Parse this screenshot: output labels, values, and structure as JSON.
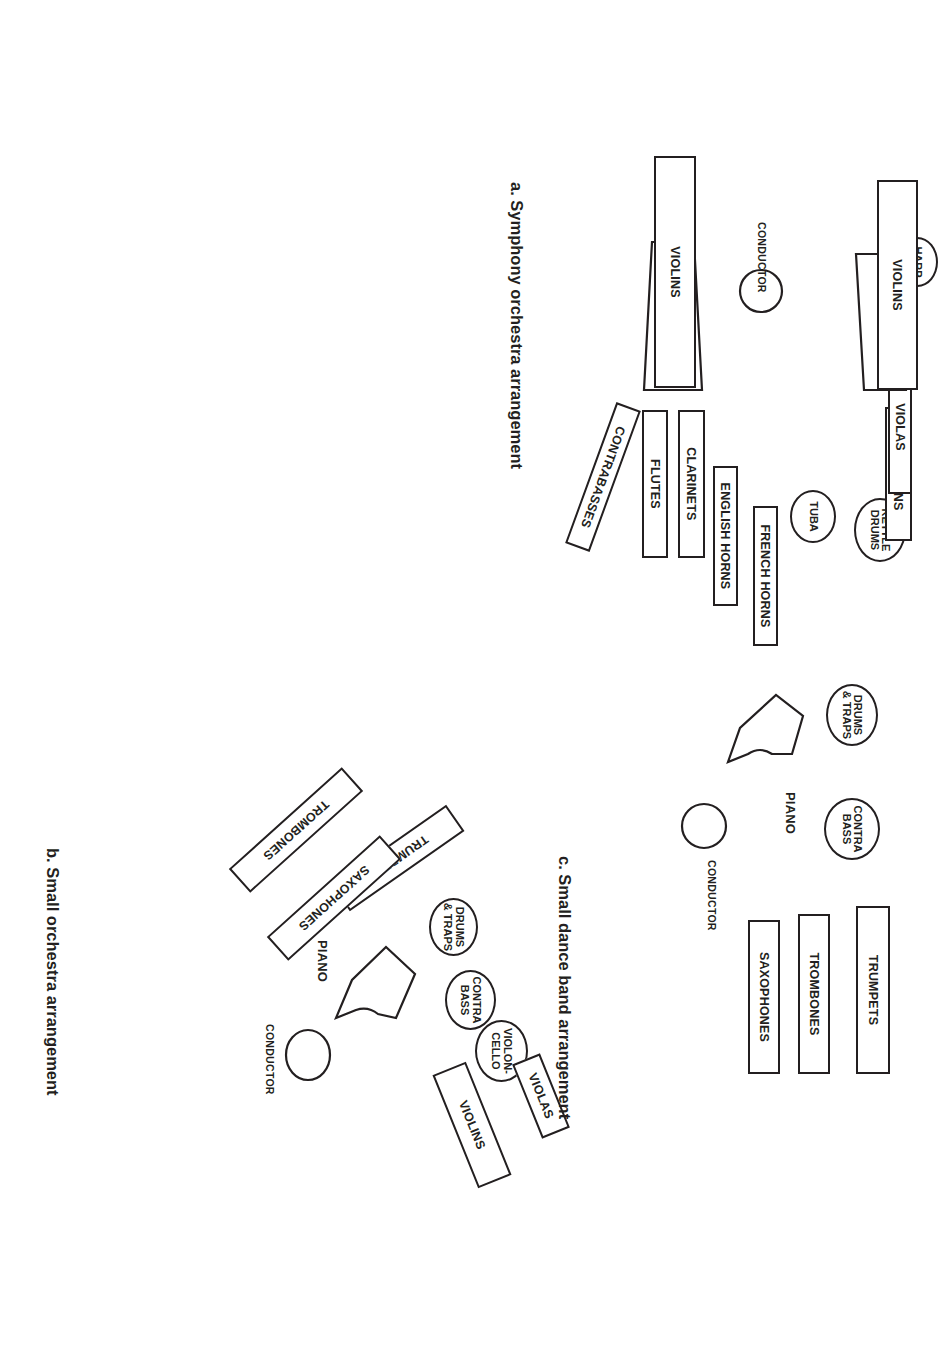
{
  "page": {
    "background": "#ffffff",
    "ink": "#231f20",
    "width": 924,
    "height": 1356,
    "orientation": "landscape-rotated-90"
  },
  "panels": [
    {
      "id": "a",
      "caption": "a. Symphony orchestra arrangement",
      "conductor_label": "CONDUCTOR",
      "sections": [
        {
          "name": "kettle-drums",
          "label": "KETTLE\nDRUMS",
          "shape": "ellipse"
        },
        {
          "name": "tuba",
          "label": "TUBA",
          "shape": "ellipse"
        },
        {
          "name": "bassoons",
          "label": "BASSOONS",
          "shape": "rect"
        },
        {
          "name": "violas-back",
          "label": "VIOLAS",
          "shape": "rect"
        },
        {
          "name": "violas-front",
          "label": "VIOLAS",
          "shape": "trapezoid"
        },
        {
          "name": "harp",
          "label": "HARP",
          "shape": "ellipse"
        },
        {
          "name": "violins-right",
          "label": "VIOLINS",
          "shape": "rect"
        },
        {
          "name": "french-horns",
          "label": "FRENCH HORNS",
          "shape": "rect"
        },
        {
          "name": "english-horns",
          "label": "ENGLISH HORNS",
          "shape": "rect"
        },
        {
          "name": "clarinets",
          "label": "CLARINETS",
          "shape": "rect"
        },
        {
          "name": "flutes",
          "label": "FLUTES",
          "shape": "rect"
        },
        {
          "name": "contrabasses",
          "label": "CONTRABASSES",
          "shape": "rect-rotated"
        },
        {
          "name": "violon-cellos",
          "label": "VIOLON-CELLOS",
          "shape": "trapezoid"
        },
        {
          "name": "violins-left",
          "label": "VIOLINS",
          "shape": "rect"
        }
      ]
    },
    {
      "id": "b",
      "caption": "b. Small orchestra arrangement",
      "conductor_label": "CONDUCTOR",
      "piano_label": "PIANO",
      "sections": [
        {
          "name": "drums-traps",
          "label": "DRUMS\n& TRAPS",
          "shape": "ellipse"
        },
        {
          "name": "contra-bass",
          "label": "CONTRA\nBASS",
          "shape": "ellipse"
        },
        {
          "name": "violon-cello",
          "label": "VIOLON-\nCELLO",
          "shape": "ellipse"
        },
        {
          "name": "violas",
          "label": "VIOLAS",
          "shape": "rect-rotated"
        },
        {
          "name": "violins",
          "label": "VIOLINS",
          "shape": "rect-rotated"
        },
        {
          "name": "piano",
          "label": "PIANO",
          "shape": "piano"
        },
        {
          "name": "trumpets",
          "label": "TRUMPETS",
          "shape": "rect-rotated"
        },
        {
          "name": "saxophones",
          "label": "SAXOPHONES",
          "shape": "rect-rotated"
        },
        {
          "name": "trombones",
          "label": "TROMBONES",
          "shape": "rect-rotated"
        }
      ]
    },
    {
      "id": "c",
      "caption": "c. Small dance band arrangement",
      "conductor_label": "CONDUCTOR",
      "piano_label": "PIANO",
      "sections": [
        {
          "name": "drums-traps",
          "label": "DRUMS\n& TRAPS",
          "shape": "ellipse"
        },
        {
          "name": "contra-bass",
          "label": "CONTRA\nBASS",
          "shape": "ellipse"
        },
        {
          "name": "piano",
          "label": "PIANO",
          "shape": "piano"
        },
        {
          "name": "trumpets",
          "label": "TRUMPETS",
          "shape": "rect"
        },
        {
          "name": "trombones",
          "label": "TROMBONES",
          "shape": "rect"
        },
        {
          "name": "saxophones",
          "label": "SAXOPHONES",
          "shape": "rect"
        }
      ]
    }
  ]
}
